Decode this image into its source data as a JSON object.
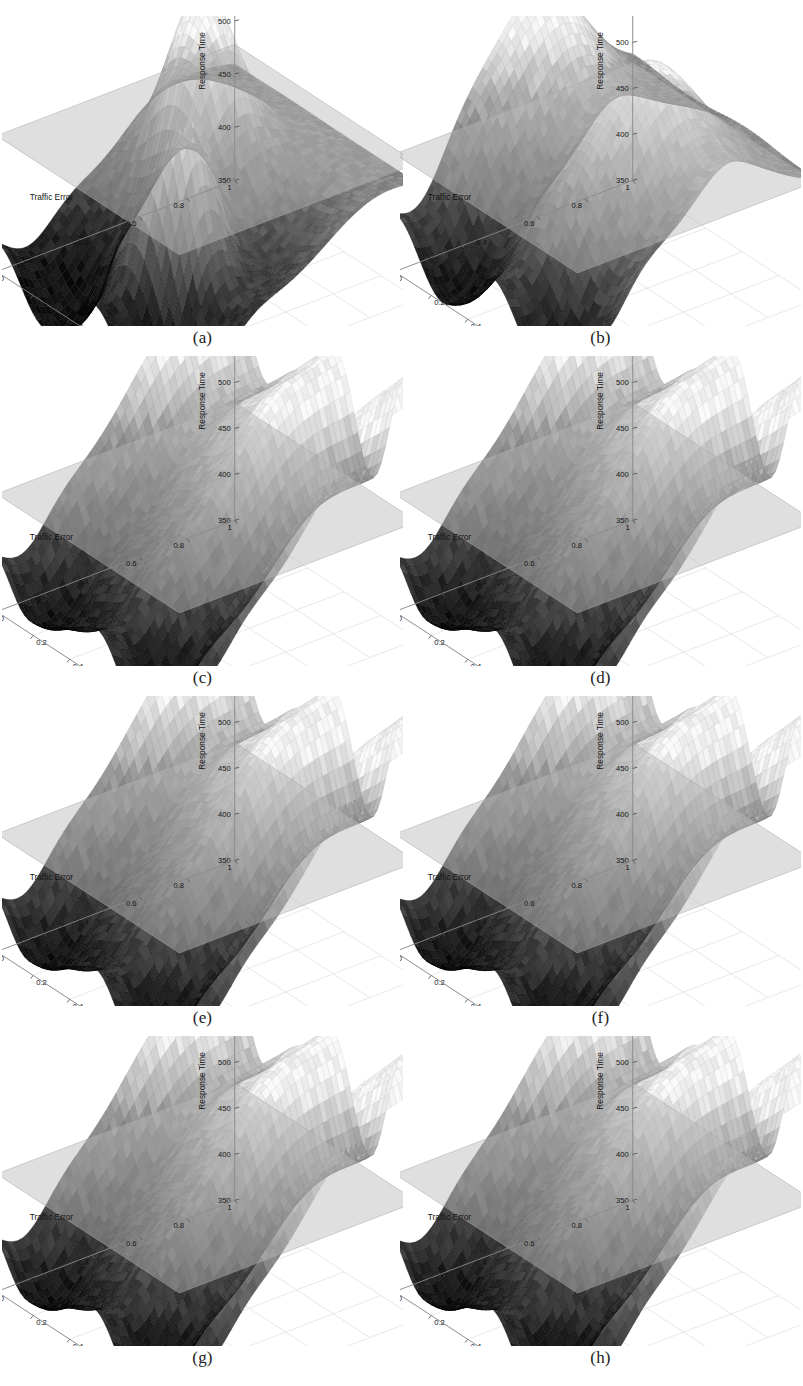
{
  "figure": {
    "kind": "multi-panel-3d-surface-figure",
    "panel_count": 8,
    "columns": 2,
    "rows": 4,
    "background": "#ffffff"
  },
  "axes_common": {
    "zlabel": "Response Time",
    "xlabel": "Traffic Error",
    "ylabel": "Location Change Probability",
    "x_ticks": [
      "1",
      "0.8",
      "0.6",
      "0.4",
      "0.2",
      "0"
    ],
    "y_ticks": [
      "0",
      "0.2",
      "0.4",
      "0.6",
      "0.8",
      "1"
    ],
    "x_range": [
      0,
      1
    ],
    "y_range": [
      0,
      1
    ],
    "reference_plane_value": 478,
    "surface_color_low": "#1c1c1c",
    "surface_color_mid": "#7a7a7a",
    "surface_color_high": "#e8e8e8",
    "plane_color": "#b9b9b9",
    "axis_color": "#8a8a8a",
    "tick_color": "#555555"
  },
  "panels": [
    {
      "id": "a",
      "caption": "(a)",
      "z_ticks": [
        "350",
        "400",
        "450",
        "500",
        "550"
      ],
      "zlim": [
        350,
        575
      ],
      "chart_data": {
        "type": "surface",
        "title": "",
        "xlabel": "Traffic Error",
        "ylabel": "Location Change Probability",
        "zlabel": "Response Time",
        "xlim": [
          0,
          1
        ],
        "ylim": [
          0,
          1
        ],
        "zlim": [
          350,
          575
        ],
        "z_ticks": [
          350,
          400,
          450,
          500,
          550
        ],
        "x_ticks": [
          1,
          0.8,
          0.6,
          0.4,
          0.2,
          0
        ],
        "y_ticks": [
          0,
          0.2,
          0.4,
          0.6,
          0.8,
          1
        ],
        "reference_plane_z": 478,
        "grid": true,
        "legend": "none",
        "description": "Two tall sharp peaks near the back ridge reaching about 575; deep valleys toward the front dropping below 360.",
        "peaks": [
          {
            "x": 0.62,
            "y": 0.3,
            "z": 565
          },
          {
            "x": 0.3,
            "y": 0.55,
            "z": 575
          }
        ],
        "valleys": [
          {
            "x": 0.5,
            "y": 0.1,
            "z": 352
          },
          {
            "x": 0.15,
            "y": 0.5,
            "z": 358
          }
        ],
        "z_min": 350,
        "z_max": 575,
        "surface_mean": 455
      }
    },
    {
      "id": "b",
      "caption": "(b)",
      "z_ticks": [
        "350",
        "400",
        "450",
        "500",
        "550",
        "600"
      ],
      "zlim": [
        350,
        610
      ],
      "chart_data": {
        "type": "surface",
        "title": "",
        "xlabel": "Traffic Error",
        "ylabel": "Location Change Probability",
        "zlabel": "Response Time",
        "xlim": [
          0,
          1
        ],
        "ylim": [
          0,
          1
        ],
        "zlim": [
          350,
          610
        ],
        "z_ticks": [
          350,
          400,
          450,
          500,
          550,
          600
        ],
        "x_ticks": [
          1,
          0.8,
          0.6,
          0.4,
          0.2,
          0
        ],
        "y_ticks": [
          0,
          0.2,
          0.4,
          0.6,
          0.8,
          1
        ],
        "reference_plane_z": 478,
        "grid": true,
        "legend": "none",
        "description": "Broad rounded multi-lobed ridge at the back topping near 600, smoothing to a wavy front edge.",
        "peaks": [
          {
            "x": 0.45,
            "y": 0.45,
            "z": 598
          },
          {
            "x": 0.3,
            "y": 0.65,
            "z": 592
          }
        ],
        "valleys": [
          {
            "x": 0.5,
            "y": 0.08,
            "z": 360
          }
        ],
        "z_min": 352,
        "z_max": 600,
        "surface_mean": 468
      }
    },
    {
      "id": "c",
      "caption": "(c)",
      "z_ticks": [
        "350",
        "400",
        "450",
        "500",
        "550",
        "600"
      ],
      "zlim": [
        350,
        610
      ],
      "chart_data": {
        "type": "surface",
        "title": "",
        "xlabel": "Traffic Error",
        "ylabel": "Location Change Probability",
        "zlabel": "Response Time",
        "xlim": [
          0,
          1
        ],
        "ylim": [
          0,
          1
        ],
        "zlim": [
          350,
          610
        ],
        "z_ticks": [
          350,
          400,
          450,
          500,
          550,
          600
        ],
        "x_ticks": [
          1,
          0.8,
          0.6,
          0.4,
          0.2,
          0
        ],
        "y_ticks": [
          0,
          0.2,
          0.4,
          0.6,
          0.8,
          1
        ],
        "reference_plane_z": 478,
        "grid": true,
        "legend": "none",
        "description": "Rippled corrugated surface, four rounded crests along the back ridge near 590 descending to a scalloped front edge near 355.",
        "peaks": [
          {
            "x": 0.75,
            "y": 0.55,
            "z": 575
          },
          {
            "x": 0.5,
            "y": 0.6,
            "z": 585
          },
          {
            "x": 0.3,
            "y": 0.7,
            "z": 592
          }
        ],
        "valleys": [
          {
            "x": 0.5,
            "y": 0.05,
            "z": 355
          }
        ],
        "z_min": 355,
        "z_max": 592,
        "surface_mean": 470
      }
    },
    {
      "id": "d",
      "caption": "(d)",
      "z_ticks": [
        "350",
        "400",
        "450",
        "500",
        "550",
        "600"
      ],
      "zlim": [
        350,
        610
      ],
      "chart_data": {
        "type": "surface",
        "title": "",
        "xlabel": "Traffic Error",
        "ylabel": "Location Change Probability",
        "zlabel": "Response Time",
        "xlim": [
          0,
          1
        ],
        "ylim": [
          0,
          1
        ],
        "zlim": [
          350,
          610
        ],
        "z_ticks": [
          350,
          400,
          450,
          500,
          550,
          600
        ],
        "x_ticks": [
          1,
          0.8,
          0.6,
          0.4,
          0.2,
          0
        ],
        "y_ticks": [
          0,
          0.2,
          0.4,
          0.6,
          0.8,
          1
        ],
        "reference_plane_z": 478,
        "grid": true,
        "legend": "none",
        "description": "Corrugated surface nearly identical to panel (c), ridge crests near 590 and scalloped front trough near 355.",
        "peaks": [
          {
            "x": 0.75,
            "y": 0.55,
            "z": 574
          },
          {
            "x": 0.5,
            "y": 0.6,
            "z": 586
          },
          {
            "x": 0.3,
            "y": 0.7,
            "z": 593
          }
        ],
        "valleys": [
          {
            "x": 0.5,
            "y": 0.05,
            "z": 356
          }
        ],
        "z_min": 356,
        "z_max": 593,
        "surface_mean": 470
      }
    },
    {
      "id": "e",
      "caption": "(e)",
      "z_ticks": [
        "350",
        "400",
        "450",
        "500",
        "550",
        "600"
      ],
      "zlim": [
        350,
        610
      ],
      "chart_data": {
        "type": "surface",
        "title": "",
        "xlabel": "Traffic Error",
        "ylabel": "Location Change Probability",
        "zlabel": "Response Time",
        "xlim": [
          0,
          1
        ],
        "ylim": [
          0,
          1
        ],
        "zlim": [
          350,
          610
        ],
        "z_ticks": [
          350,
          400,
          450,
          500,
          550,
          600
        ],
        "x_ticks": [
          1,
          0.8,
          0.6,
          0.4,
          0.2,
          0
        ],
        "y_ticks": [
          0,
          0.2,
          0.4,
          0.6,
          0.8,
          1
        ],
        "reference_plane_z": 478,
        "grid": true,
        "legend": "none",
        "description": "Rippled surface with four back crests approaching 590 and a wavy front edge near 357.",
        "peaks": [
          {
            "x": 0.75,
            "y": 0.55,
            "z": 572
          },
          {
            "x": 0.5,
            "y": 0.6,
            "z": 584
          },
          {
            "x": 0.3,
            "y": 0.7,
            "z": 590
          }
        ],
        "valleys": [
          {
            "x": 0.5,
            "y": 0.05,
            "z": 357
          }
        ],
        "z_min": 357,
        "z_max": 590,
        "surface_mean": 469
      }
    },
    {
      "id": "f",
      "caption": "(f)",
      "z_ticks": [
        "350",
        "400",
        "450",
        "500",
        "550",
        "600"
      ],
      "zlim": [
        350,
        610
      ],
      "chart_data": {
        "type": "surface",
        "title": "",
        "xlabel": "Traffic Error",
        "ylabel": "Location Change Probability",
        "zlabel": "Response Time",
        "xlim": [
          0,
          1
        ],
        "ylim": [
          0,
          1
        ],
        "zlim": [
          350,
          610
        ],
        "z_ticks": [
          350,
          400,
          450,
          500,
          550,
          600
        ],
        "x_ticks": [
          1,
          0.8,
          0.6,
          0.4,
          0.2,
          0
        ],
        "y_ticks": [
          0,
          0.2,
          0.4,
          0.6,
          0.8,
          1
        ],
        "reference_plane_z": 478,
        "grid": true,
        "legend": "none",
        "description": "Corrugated surface matching the (c)-(e) family with back crests near 590 and a scalloped front.",
        "peaks": [
          {
            "x": 0.75,
            "y": 0.55,
            "z": 573
          },
          {
            "x": 0.5,
            "y": 0.6,
            "z": 585
          },
          {
            "x": 0.3,
            "y": 0.7,
            "z": 591
          }
        ],
        "valleys": [
          {
            "x": 0.5,
            "y": 0.05,
            "z": 356
          }
        ],
        "z_min": 356,
        "z_max": 591,
        "surface_mean": 470
      }
    },
    {
      "id": "g",
      "caption": "(g)",
      "z_ticks": [
        "350",
        "400",
        "450",
        "500",
        "550",
        "600"
      ],
      "zlim": [
        350,
        610
      ],
      "chart_data": {
        "type": "surface",
        "title": "",
        "xlabel": "Traffic Error",
        "ylabel": "Location Change Probability",
        "zlabel": "Response Time",
        "xlim": [
          0,
          1
        ],
        "ylim": [
          0,
          1
        ],
        "zlim": [
          350,
          610
        ],
        "z_ticks": [
          350,
          400,
          450,
          500,
          550,
          600
        ],
        "x_ticks": [
          1,
          0.8,
          0.6,
          0.4,
          0.2,
          0
        ],
        "y_ticks": [
          0,
          0.2,
          0.4,
          0.6,
          0.8,
          1
        ],
        "reference_plane_z": 478,
        "grid": true,
        "legend": "none",
        "description": "Rippled surface with back crests near 590 descending through the reference plane to a wavy front near 356.",
        "peaks": [
          {
            "x": 0.75,
            "y": 0.55,
            "z": 574
          },
          {
            "x": 0.5,
            "y": 0.6,
            "z": 586
          },
          {
            "x": 0.3,
            "y": 0.7,
            "z": 592
          }
        ],
        "valleys": [
          {
            "x": 0.5,
            "y": 0.05,
            "z": 356
          }
        ],
        "z_min": 356,
        "z_max": 592,
        "surface_mean": 470
      }
    },
    {
      "id": "h",
      "caption": "(h)",
      "z_ticks": [
        "350",
        "400",
        "450",
        "500",
        "550",
        "600"
      ],
      "zlim": [
        350,
        610
      ],
      "chart_data": {
        "type": "surface",
        "title": "",
        "xlabel": "Traffic Error",
        "ylabel": "Location Change Probability",
        "zlabel": "Response Time",
        "xlim": [
          0,
          1
        ],
        "ylim": [
          0,
          1
        ],
        "zlim": [
          350,
          610
        ],
        "z_ticks": [
          350,
          400,
          450,
          500,
          550,
          600
        ],
        "x_ticks": [
          1,
          0.8,
          0.6,
          0.4,
          0.2,
          0
        ],
        "y_ticks": [
          0,
          0.2,
          0.4,
          0.6,
          0.8,
          1
        ],
        "reference_plane_z": 478,
        "grid": true,
        "legend": "none",
        "description": "Final corrugated surface of the series, back crests near 590, front trough near 356.",
        "peaks": [
          {
            "x": 0.75,
            "y": 0.55,
            "z": 573
          },
          {
            "x": 0.5,
            "y": 0.6,
            "z": 585
          },
          {
            "x": 0.3,
            "y": 0.7,
            "z": 591
          }
        ],
        "valleys": [
          {
            "x": 0.5,
            "y": 0.05,
            "z": 356
          }
        ],
        "z_min": 356,
        "z_max": 591,
        "surface_mean": 470
      }
    }
  ]
}
